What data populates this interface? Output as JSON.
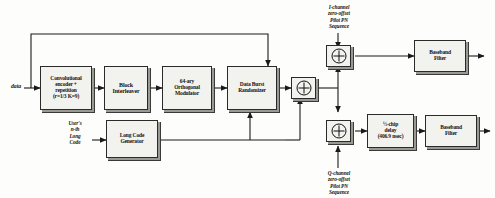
{
  "diagram": {
    "input_label": "data",
    "blocks": [
      {
        "id": "conv",
        "lines": [
          "Convolutional",
          "encoder +",
          "repetition",
          "(r=1/3 K=9)"
        ]
      },
      {
        "id": "interleaver",
        "lines": [
          "Block",
          "Interleaver"
        ]
      },
      {
        "id": "modulator",
        "lines": [
          "64-ary",
          "Orthogonal",
          "Modulator"
        ]
      },
      {
        "id": "randomizer",
        "lines": [
          "Data Burst",
          "Randomizer"
        ]
      },
      {
        "id": "longcode",
        "lines": [
          "Long Code",
          "Generator"
        ]
      },
      {
        "id": "halfchip",
        "lines": [
          "½-chip",
          "delay",
          "(406.9 nsec)"
        ]
      },
      {
        "id": "bbfilter-i",
        "lines": [
          "Baseband",
          "Filter"
        ]
      },
      {
        "id": "bbfilter-q",
        "lines": [
          "Baseband",
          "Filter"
        ]
      }
    ],
    "annotations": [
      {
        "id": "longcode-input",
        "lines": [
          "User's",
          "n-th",
          "Long",
          "Code"
        ]
      },
      {
        "id": "i-channel-pn",
        "lines": [
          "I-channel",
          "zero-offset",
          "Pilot PN",
          "Sequence"
        ]
      },
      {
        "id": "q-channel-pn",
        "lines": [
          "Q-channel",
          "zero-offset",
          "Pilot PN",
          "Sequence"
        ]
      }
    ],
    "operators": [
      {
        "id": "xor-longcode",
        "symbol": "⊕"
      },
      {
        "id": "xor-i",
        "symbol": "⊕"
      },
      {
        "id": "xor-q",
        "symbol": "⊕"
      }
    ],
    "colors": {
      "line": "#1a1a1a",
      "block_fill": "#f2f2ef",
      "block_edge": "#2a2a2a",
      "shadow": "#9a9a95"
    }
  }
}
